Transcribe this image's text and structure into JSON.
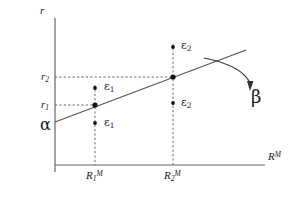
{
  "figure": {
    "title": "",
    "background_color": "#ffffff",
    "ink_color": "#4d4d4d",
    "text_color": "#1a1a1a"
  },
  "axes": {
    "y_axis_label": "r",
    "x_axis_label_base": "R",
    "x_axis_label_sup": "M",
    "origin_px": {
      "x": 55,
      "y": 165
    },
    "x_axis_end_px": {
      "x": 265,
      "y": 165
    },
    "y_axis_top_px": {
      "x": 55,
      "y": 18
    }
  },
  "y_ticks": [
    {
      "name": "r2",
      "base": "r",
      "sub": "2",
      "y_px": 77,
      "label_x_px": 41,
      "label_y_px": 71
    },
    {
      "name": "r1",
      "base": "r",
      "sub": "1",
      "y_px": 105,
      "label_x_px": 41,
      "label_y_px": 99
    }
  ],
  "x_ticks": [
    {
      "name": "R1M",
      "base": "R",
      "sub": "1",
      "sup": "M",
      "x_px": 95,
      "label_x_px": 86,
      "label_y_px": 170
    },
    {
      "name": "R2M",
      "base": "R",
      "sub": "2",
      "sup": "M",
      "x_px": 173,
      "label_x_px": 164,
      "label_y_px": 170
    }
  ],
  "regression_line": {
    "name": "regression-line",
    "intercept_label": "α",
    "intercept_label_x_px": 40,
    "intercept_label_y_px": 117,
    "slope_label": "β",
    "slope_label_x_px": 251,
    "slope_label_y_px": 88,
    "start_px": {
      "x": 55,
      "y": 122
    },
    "end_px": {
      "x": 246,
      "y": 50
    },
    "fit_points": [
      {
        "x_px": 95,
        "y_px": 105
      },
      {
        "x_px": 173,
        "y_px": 77
      }
    ]
  },
  "slope_arrow": {
    "name": "beta-callout-arrow",
    "path": "M 204 58 C 224 62, 244 70, 250 83",
    "arrowhead_tip_px": {
      "x": 251,
      "y": 90
    }
  },
  "residuals": [
    {
      "name": "residual-eps1-upper",
      "symbol": "ε",
      "sub": "1",
      "point_px": {
        "x": 95,
        "y": 88
      },
      "label_x_px": 104,
      "label_y_px": 81
    },
    {
      "name": "residual-eps1-lower",
      "symbol": "ε",
      "sub": "1",
      "point_px": {
        "x": 95,
        "y": 123
      },
      "label_x_px": 104,
      "label_y_px": 117
    },
    {
      "name": "residual-eps2-upper",
      "symbol": "ε",
      "sub": "2",
      "point_px": {
        "x": 173,
        "y": 47
      },
      "label_x_px": 181,
      "label_y_px": 40
    },
    {
      "name": "residual-eps2-lower",
      "symbol": "ε",
      "sub": "2",
      "point_px": {
        "x": 173,
        "y": 103
      },
      "label_x_px": 181,
      "label_y_px": 97
    }
  ],
  "guide_lines": {
    "vertical_dashed": [
      {
        "name": "dashed-vline-R1M",
        "x_px": 95,
        "y_top_px": 85,
        "y_bottom_px": 165
      },
      {
        "name": "dashed-vline-R2M",
        "x_px": 173,
        "y_top_px": 44,
        "y_bottom_px": 165
      }
    ],
    "horizontal_dashed": [
      {
        "name": "dashed-hline-r2",
        "y_px": 77,
        "x_left_px": 55,
        "x_right_px": 173
      },
      {
        "name": "dashed-hline-r1",
        "y_px": 105,
        "x_left_px": 55,
        "x_right_px": 95
      }
    ]
  }
}
